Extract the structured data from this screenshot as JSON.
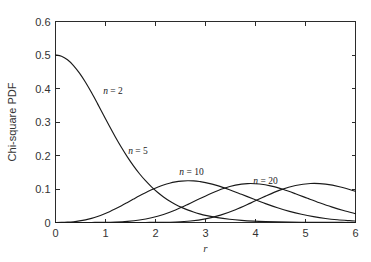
{
  "figure": {
    "background_color": "#ffffff",
    "axes_color": "#2b2b2b",
    "curve_color": "#1a1a1a",
    "text_color": "#333333"
  },
  "chart_data": {
    "type": "line",
    "title": "",
    "xlabel": "r",
    "ylabel": "Chi-square PDF",
    "xlim": [
      0,
      6
    ],
    "ylim": [
      0,
      0.6
    ],
    "xticks": [
      0,
      1,
      2,
      3,
      4,
      5,
      6
    ],
    "xtick_labels": [
      "0",
      "1",
      "2",
      "3",
      "4",
      "5",
      "6"
    ],
    "yticks": [
      0,
      0.1,
      0.2,
      0.3,
      0.4,
      0.5,
      0.6
    ],
    "ytick_labels": [
      "0",
      "0.1",
      "0.2",
      "0.3",
      "0.4",
      "0.5",
      "0.6"
    ],
    "grid": false,
    "legend_position": "inline-annotations",
    "annotations": [
      {
        "text": "n = 2",
        "italic_part": "n",
        "rest": " = 2",
        "x": 1.15,
        "y": 0.385
      },
      {
        "text": "n = 5",
        "italic_part": "n",
        "rest": " = 5",
        "x": 1.65,
        "y": 0.205
      },
      {
        "text": "n = 10",
        "italic_part": "n",
        "rest": " = 10",
        "x": 2.72,
        "y": 0.143
      },
      {
        "text": "n = 20",
        "italic_part": "n",
        "rest": " = 20",
        "x": 4.2,
        "y": 0.115
      }
    ],
    "series": [
      {
        "name": "n = 2",
        "degrees_of_freedom": 2,
        "peak_x": 0.0,
        "peak_y": 0.5,
        "x": [
          0.0,
          0.12,
          0.24,
          0.36,
          0.48,
          0.6,
          0.72,
          0.84,
          0.96,
          1.08,
          1.2,
          1.32,
          1.44,
          1.56,
          1.68,
          1.8,
          1.92,
          2.04,
          2.16,
          2.28,
          2.4,
          2.52,
          2.64,
          2.76,
          2.88,
          3.0,
          3.24,
          3.48,
          3.72,
          3.96,
          4.2,
          4.44,
          4.68,
          4.92,
          5.16,
          5.4,
          5.64,
          5.88,
          6.0
        ],
        "y": [
          0.5,
          0.4964,
          0.4857,
          0.4686,
          0.4458,
          0.4185,
          0.3878,
          0.3549,
          0.3211,
          0.2874,
          0.2547,
          0.2238,
          0.1951,
          0.169,
          0.1455,
          0.1247,
          0.1063,
          0.0902,
          0.0763,
          0.0642,
          0.0539,
          0.0451,
          0.0376,
          0.0312,
          0.0259,
          0.0214,
          0.0145,
          0.0097,
          0.0064,
          0.0042,
          0.0027,
          0.0017,
          0.0011,
          0.0007,
          0.0004,
          0.0003,
          0.0002,
          0.0001,
          0.0001
        ]
      },
      {
        "name": "n = 5",
        "degrees_of_freedom": 5,
        "peak_x": 1.75,
        "peak_y": 0.154,
        "x": [
          0.0,
          0.12,
          0.24,
          0.36,
          0.48,
          0.6,
          0.72,
          0.84,
          0.96,
          1.08,
          1.2,
          1.32,
          1.44,
          1.56,
          1.68,
          1.8,
          1.92,
          2.04,
          2.16,
          2.28,
          2.4,
          2.52,
          2.64,
          2.76,
          2.88,
          3.0,
          3.24,
          3.48,
          3.72,
          3.96,
          4.2,
          4.44,
          4.68,
          4.92,
          5.16,
          5.4,
          5.64,
          5.88,
          6.0
        ],
        "y": [
          0.0,
          0.0002,
          0.001,
          0.0024,
          0.0047,
          0.008,
          0.0124,
          0.018,
          0.0247,
          0.0324,
          0.041,
          0.0503,
          0.06,
          0.0699,
          0.0796,
          0.0889,
          0.0976,
          0.1053,
          0.1119,
          0.1172,
          0.1211,
          0.1235,
          0.1245,
          0.1241,
          0.1223,
          0.1192,
          0.1101,
          0.098,
          0.0842,
          0.07,
          0.0564,
          0.044,
          0.0333,
          0.0245,
          0.0175,
          0.0121,
          0.0082,
          0.0054,
          0.0043
        ]
      },
      {
        "name": "n = 10",
        "degrees_of_freedom": 10,
        "peak_x": 2.9,
        "peak_y": 0.1,
        "x": [
          0.0,
          0.24,
          0.48,
          0.72,
          0.96,
          1.2,
          1.44,
          1.68,
          1.92,
          2.16,
          2.4,
          2.64,
          2.88,
          3.12,
          3.36,
          3.6,
          3.84,
          4.08,
          4.32,
          4.56,
          4.8,
          5.04,
          5.28,
          5.52,
          5.76,
          6.0
        ],
        "y": [
          0.0,
          0.0,
          0.0,
          0.0001,
          0.0004,
          0.0013,
          0.0034,
          0.0074,
          0.0141,
          0.0241,
          0.0374,
          0.0534,
          0.0707,
          0.0875,
          0.1017,
          0.1116,
          0.1161,
          0.1148,
          0.1085,
          0.0983,
          0.0858,
          0.0723,
          0.059,
          0.0466,
          0.0357,
          0.0266
        ]
      },
      {
        "name": "n = 20",
        "degrees_of_freedom": 20,
        "peak_x": 4.3,
        "peak_y": 0.07,
        "x": [
          0.0,
          0.3,
          0.6,
          0.9,
          1.2,
          1.5,
          1.8,
          2.1,
          2.4,
          2.7,
          3.0,
          3.3,
          3.6,
          3.9,
          4.2,
          4.5,
          4.8,
          5.1,
          5.4,
          5.7,
          6.0
        ],
        "y": [
          0.0,
          0.0,
          0.0,
          0.0,
          0.0,
          0.0,
          0.0001,
          0.0004,
          0.0015,
          0.0045,
          0.0109,
          0.0219,
          0.0379,
          0.0578,
          0.0788,
          0.0974,
          0.1106,
          0.1164,
          0.1146,
          0.1061,
          0.0927
        ]
      }
    ]
  }
}
